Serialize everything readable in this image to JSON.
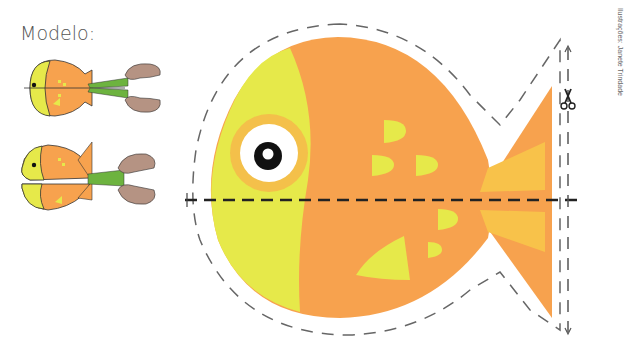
{
  "model_label": "Modelo:",
  "credit": "Ilustrações: Janete Trindade",
  "colors": {
    "fish_orange": "#F7A24E",
    "fish_yellow": "#E6E94A",
    "eye_ring": "#F6B84A",
    "tail_stripe": "#F8C24A",
    "hand": "#B59383",
    "scissors_handle": "#6DB33F",
    "cut_line": "#222222",
    "outline_dash": "#666666"
  },
  "icons": {
    "scissors": "scissors-icon"
  }
}
